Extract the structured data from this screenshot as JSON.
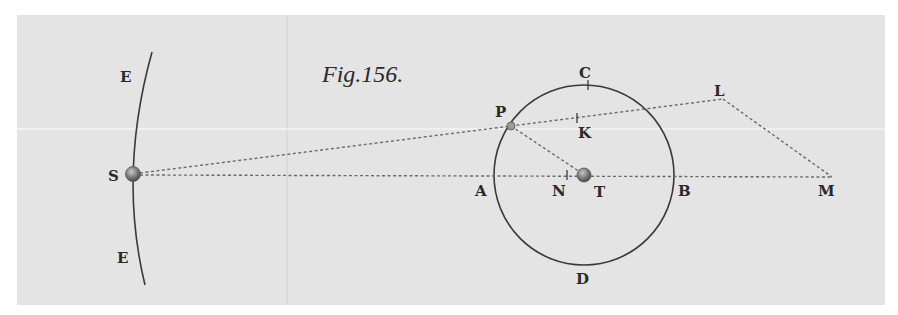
{
  "figure": {
    "title": "Fig.156.",
    "colors": {
      "plate_bg": "#e4e4e4",
      "ink": "#3a3a3a",
      "dotted": "#6a6a6a",
      "page_bg": "#ffffff"
    },
    "labels": {
      "E_top": "E",
      "E_bottom": "E",
      "S": "S",
      "P": "P",
      "C": "C",
      "K": "K",
      "L": "L",
      "A": "A",
      "N": "N",
      "T": "T",
      "B": "B",
      "M": "M",
      "D": "D"
    },
    "points": {
      "S": [
        132,
        174
      ],
      "P": [
        511,
        126
      ],
      "T": [
        584,
        175
      ],
      "L": [
        723,
        99
      ],
      "M": [
        832,
        177
      ],
      "K": [
        579,
        118
      ],
      "N": [
        567,
        175
      ]
    },
    "circle": {
      "center": [
        584,
        175
      ],
      "radius": 90
    }
  }
}
